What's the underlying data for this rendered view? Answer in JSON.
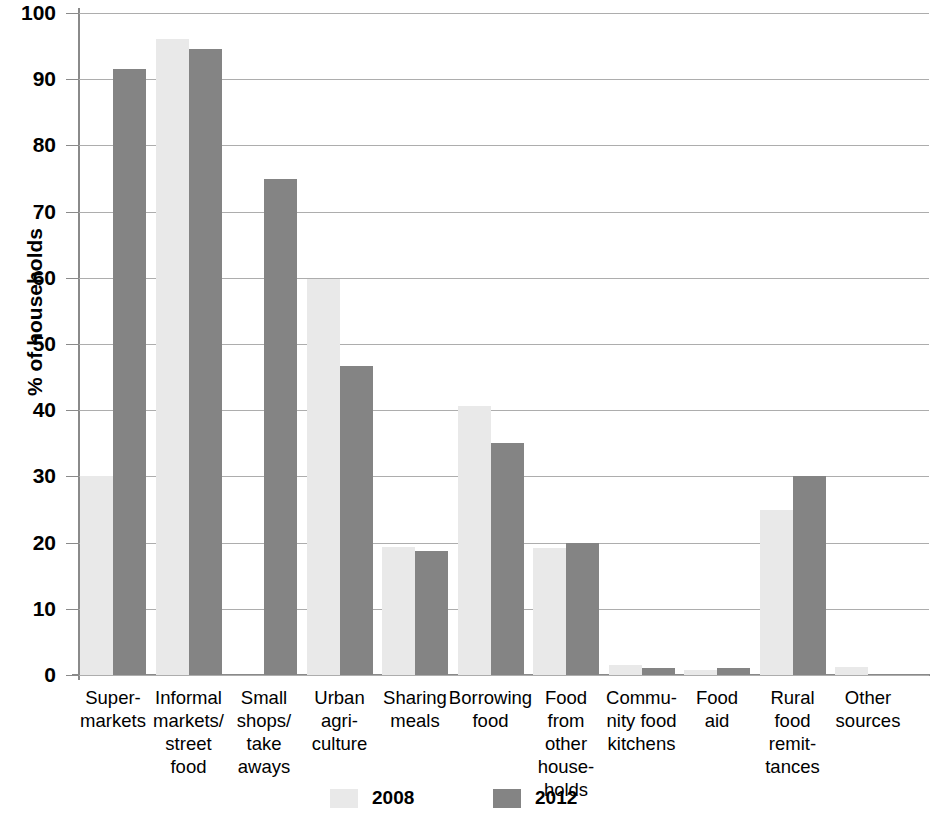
{
  "chart_data": {
    "type": "bar",
    "title": "",
    "xlabel": "",
    "ylabel": "% of households",
    "ylim": [
      0,
      100
    ],
    "ytick_step": 10,
    "yticks": [
      "100",
      "90",
      "80",
      "70",
      "60",
      "50",
      "40",
      "30",
      "20",
      "10",
      "0"
    ],
    "grid": true,
    "legend_position": "bottom",
    "categories": [
      "Super-\nmarkets",
      "Informal\nmarkets/\nstreet food",
      "Small\nshops/\ntake\naways",
      "Urban\nagri-\nculture",
      "Sharing\nmeals",
      "Borrowing\nfood",
      "Food\nfrom\nother\nhouse-\nholds",
      "Commu-\nnity food\nkitchens",
      "Food\naid",
      "Rural\nfood\nremit-\ntances",
      "Other\nsources"
    ],
    "series": [
      {
        "name": "2008",
        "color": "#e9e9e9",
        "values": [
          30.0,
          96.0,
          0.0,
          59.8,
          19.3,
          40.6,
          19.2,
          1.5,
          0.7,
          25.0,
          1.2
        ]
      },
      {
        "name": "2012",
        "color": "#848484",
        "values": [
          91.5,
          94.6,
          75.0,
          46.7,
          18.8,
          35.0,
          20.0,
          1.0,
          1.0,
          30.0,
          0.0
        ]
      }
    ]
  },
  "legend": {
    "items": [
      {
        "label": "2008",
        "swatch": "s2008"
      },
      {
        "label": "2012",
        "swatch": "s2012"
      }
    ]
  },
  "colors": {
    "series_2008": "#e9e9e9",
    "series_2012": "#848484",
    "gridline": "#adadad",
    "axis": "#8a8a8a",
    "text": "#000000",
    "background": "#ffffff"
  }
}
